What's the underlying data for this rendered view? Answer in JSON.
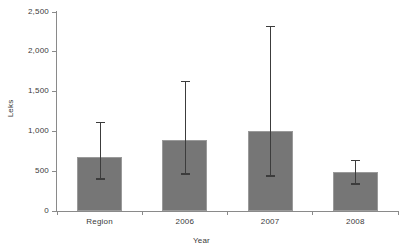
{
  "chart_data": {
    "type": "bar",
    "title": "",
    "xlabel": "Year",
    "ylabel": "Leks",
    "categories": [
      "Region",
      "2006",
      "2007",
      "2008"
    ],
    "values": [
      675,
      890,
      1005,
      490
    ],
    "errors_low": [
      415,
      475,
      450,
      350
    ],
    "errors_high": [
      1120,
      1630,
      2325,
      640
    ],
    "ylim": [
      0,
      2500
    ],
    "ytick_values": [
      0,
      500,
      1000,
      1500,
      2000,
      2500
    ],
    "ytick_labels": [
      "0",
      "500",
      "1,000",
      "1,500",
      "2,000",
      "2,500"
    ],
    "grid": false,
    "legend": "none",
    "bar_color": "#767676",
    "error_color": "#3c3c3c",
    "axis_color": "#8a8a8a",
    "background": "#ffffff"
  }
}
